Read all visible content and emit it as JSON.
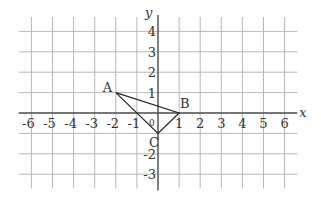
{
  "diagram": {
    "type": "coordinate-plane",
    "x_axis": {
      "label": "x",
      "min": -6,
      "max": 6,
      "tick_labels": [
        "-6",
        "-5",
        "-4",
        "-3",
        "-2",
        "-1",
        "1",
        "2",
        "3",
        "4",
        "5",
        "6"
      ]
    },
    "y_axis": {
      "label": "y",
      "min": -3,
      "max": 4,
      "tick_labels": [
        "4",
        "3",
        "2",
        "1",
        "-2",
        "-3"
      ]
    },
    "origin_label": "0",
    "grid": {
      "x_min": -6.6,
      "x_max": 6.6,
      "y_min": -3.7,
      "y_max": 4.7
    },
    "triangle": {
      "vertices": [
        {
          "name": "A",
          "x": -2,
          "y": 1
        },
        {
          "name": "B",
          "x": 1,
          "y": 0
        },
        {
          "name": "C",
          "x": 0,
          "y": -1
        }
      ]
    },
    "colors": {
      "grid": "#b8b8b8",
      "axis": "#4a4a4a",
      "triangle": "#2a2a2a",
      "text": "#333333"
    }
  }
}
